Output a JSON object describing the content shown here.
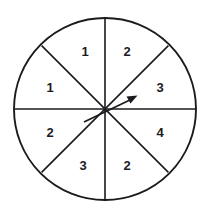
{
  "figure": {
    "name": "spinner-wheel",
    "type": "eight-sector-spinner",
    "background_color": "#ffffff",
    "line_color": "#1b1b1f",
    "geometry": {
      "center_x": 105,
      "center_y": 109,
      "radius": 91
    },
    "sectors": [
      {
        "id": "sector-top-left",
        "label": "1",
        "start_deg": 225,
        "end_deg": 270,
        "label_x": 85,
        "label_y": 56
      },
      {
        "id": "sector-top-right",
        "label": "2",
        "start_deg": 270,
        "end_deg": 315,
        "label_x": 127,
        "label_y": 56
      },
      {
        "id": "sector-right-upper",
        "label": "3",
        "start_deg": 315,
        "end_deg": 360,
        "label_x": 160,
        "label_y": 92
      },
      {
        "id": "sector-right-lower",
        "label": "4",
        "start_deg": 0,
        "end_deg": 45,
        "label_x": 160,
        "label_y": 137
      },
      {
        "id": "sector-bottom-right",
        "label": "2",
        "start_deg": 45,
        "end_deg": 90,
        "label_x": 127,
        "label_y": 170
      },
      {
        "id": "sector-bottom-left",
        "label": "3",
        "start_deg": 90,
        "end_deg": 135,
        "label_x": 83,
        "label_y": 170
      },
      {
        "id": "sector-left-lower",
        "label": "2",
        "start_deg": 135,
        "end_deg": 180,
        "label_x": 50,
        "label_y": 137
      },
      {
        "id": "sector-left-upper",
        "label": "1",
        "start_deg": 180,
        "end_deg": 225,
        "label_x": 50,
        "label_y": 92
      }
    ],
    "dividers": [
      {
        "id": "divider-vertical",
        "x1": 105,
        "y1": 18,
        "x2": 105,
        "y2": 200
      },
      {
        "id": "divider-horizontal",
        "x1": 14,
        "y1": 109,
        "x2": 196,
        "y2": 109
      },
      {
        "id": "divider-diagonal-nwse",
        "x1": 41,
        "y1": 45,
        "x2": 169,
        "y2": 173
      },
      {
        "id": "divider-diagonal-swne",
        "x1": 41,
        "y1": 173,
        "x2": 169,
        "y2": 45
      }
    ],
    "pointer": {
      "id": "spinner-pointer",
      "tip_x": 137,
      "tip_y": 96,
      "tail_x": 84,
      "tail_y": 122,
      "pivot_x": 105,
      "pivot_y": 109,
      "direction_deg": 26
    }
  }
}
